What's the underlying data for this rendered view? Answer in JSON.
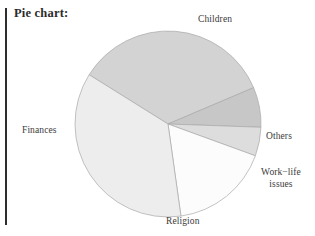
{
  "page": {
    "title": "Pie chart:",
    "background_color": "#ffffff",
    "rule_color": "#2e2e2e"
  },
  "chart_data": {
    "type": "pie",
    "title": "Pie chart:",
    "xlabel": "",
    "ylabel": "",
    "grid": false,
    "legend_position": "outside-labels",
    "center": [
      168,
      124
    ],
    "radius": 93,
    "start_angle_deg": -148,
    "direction": "clockwise",
    "categories": [
      "Children",
      "Others",
      "Work-life issues",
      "Religion",
      "Finances"
    ],
    "values": [
      34.7,
      6.9,
      5.0,
      17.2,
      36.2
    ],
    "labels": [
      "Children",
      "Others",
      "Work−life issues",
      "Religion",
      "Finances"
    ],
    "slices": [
      {
        "name": "Children",
        "label": "Children",
        "value": 34.7,
        "angle_deg": 125,
        "color": "#d3d3d3",
        "stroke": "#a9a9a9"
      },
      {
        "name": "Others",
        "label": "Others",
        "value": 6.9,
        "angle_deg": 25,
        "color": "#c7c7c7",
        "stroke": "#a9a9a9"
      },
      {
        "name": "Work-life issues",
        "label": "Work−life issues",
        "label_line_1": "Work−life",
        "label_line_2": "issues",
        "value": 5.0,
        "angle_deg": 18,
        "color": "#dddddd",
        "stroke": "#a9a9a9"
      },
      {
        "name": "Religion",
        "label": "Religion",
        "value": 17.2,
        "angle_deg": 62,
        "color": "#fcfcfc",
        "stroke": "#a9a9a9"
      },
      {
        "name": "Finances",
        "label": "Finances",
        "value": 36.2,
        "angle_deg": 130,
        "color": "#ededed",
        "stroke": "#a9a9a9"
      }
    ]
  }
}
